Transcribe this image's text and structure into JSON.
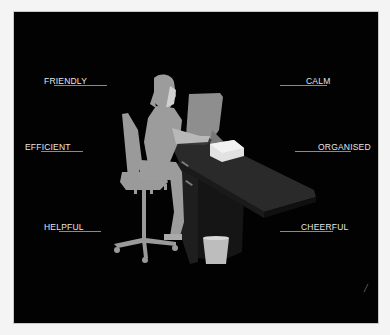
{
  "illustration": {
    "subject": "receptionist seated at reception desk",
    "colors": {
      "background": "#020202",
      "frame": "#f4f4f4",
      "figure": "#9a9a9a",
      "monitor": "#8c8c8c",
      "desk_top": "#262626",
      "desk_side": "#151515",
      "paper_stack": "#e8e8e8",
      "bin": "#bdbdbd",
      "label_text": "#e6e6e6",
      "rule": "#8a8a8a"
    }
  },
  "labels": {
    "left": [
      {
        "text": "FRIENDLY"
      },
      {
        "text": "EFFICIENT"
      },
      {
        "text": "HELPFUL"
      }
    ],
    "right": [
      {
        "text": "CALM"
      },
      {
        "text": "ORGANISED"
      },
      {
        "text": "CHEERFUL"
      }
    ]
  }
}
